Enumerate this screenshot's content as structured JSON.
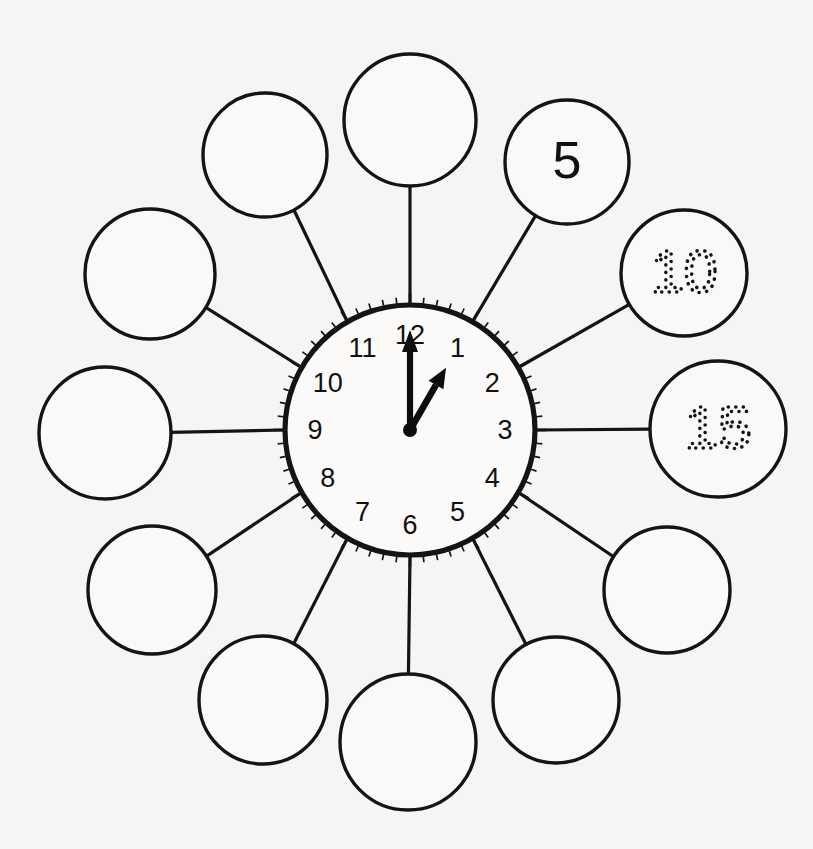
{
  "page": {
    "background_color": "#f6f5f3",
    "ink_color": "#141414",
    "width": 813,
    "height": 849
  },
  "clock": {
    "label": "analog-clock-face",
    "center_x": 410,
    "center_y": 430,
    "rim_radius": 125,
    "numeral_radius": 95,
    "displayed_time": "1:00",
    "hour_hand_points_to": 1,
    "minute_hand_points_to": 12,
    "minute_hand_length": 100,
    "hour_hand_length": 72,
    "hour_numerals": [
      {
        "hour": 12,
        "label": "12",
        "angle_deg": 0
      },
      {
        "hour": 1,
        "label": "1",
        "angle_deg": 30
      },
      {
        "hour": 2,
        "label": "2",
        "angle_deg": 60
      },
      {
        "hour": 3,
        "label": "3",
        "angle_deg": 90
      },
      {
        "hour": 4,
        "label": "4",
        "angle_deg": 120
      },
      {
        "hour": 5,
        "label": "5",
        "angle_deg": 150
      },
      {
        "hour": 6,
        "label": "6",
        "angle_deg": 180
      },
      {
        "hour": 7,
        "label": "7",
        "angle_deg": 210
      },
      {
        "hour": 8,
        "label": "8",
        "angle_deg": 240
      },
      {
        "hour": 9,
        "label": "9",
        "angle_deg": 270
      },
      {
        "hour": 10,
        "label": "10",
        "angle_deg": 300
      },
      {
        "hour": 11,
        "label": "11",
        "angle_deg": 330
      }
    ],
    "minute_ticks": 60,
    "ticks_outside_rim": true
  },
  "bubbles": [
    {
      "position": 12,
      "angle_deg": 0,
      "cx": 410,
      "cy": 120,
      "r": 66,
      "value": "",
      "style": "blank",
      "name": "answer-bubble-12"
    },
    {
      "position": 1,
      "angle_deg": 30,
      "cx": 567,
      "cy": 162,
      "r": 62,
      "value": "5",
      "style": "solid",
      "name": "answer-bubble-1"
    },
    {
      "position": 2,
      "angle_deg": 60,
      "cx": 684,
      "cy": 273,
      "r": 63,
      "value": "10",
      "style": "dotted",
      "name": "answer-bubble-2"
    },
    {
      "position": 3,
      "angle_deg": 90,
      "cx": 718,
      "cy": 429,
      "r": 68,
      "value": "15",
      "style": "dotted",
      "name": "answer-bubble-3"
    },
    {
      "position": 4,
      "angle_deg": 120,
      "cx": 667,
      "cy": 590,
      "r": 63,
      "value": "",
      "style": "blank",
      "name": "answer-bubble-4"
    },
    {
      "position": 5,
      "angle_deg": 150,
      "cx": 556,
      "cy": 700,
      "r": 63,
      "value": "",
      "style": "blank",
      "name": "answer-bubble-5"
    },
    {
      "position": 6,
      "angle_deg": 180,
      "cx": 408,
      "cy": 742,
      "r": 68,
      "value": "",
      "style": "blank",
      "name": "answer-bubble-6"
    },
    {
      "position": 7,
      "angle_deg": 210,
      "cx": 263,
      "cy": 700,
      "r": 64,
      "value": "",
      "style": "blank",
      "name": "answer-bubble-7"
    },
    {
      "position": 8,
      "angle_deg": 240,
      "cx": 152,
      "cy": 590,
      "r": 64,
      "value": "",
      "style": "blank",
      "name": "answer-bubble-8"
    },
    {
      "position": 9,
      "angle_deg": 270,
      "cx": 105,
      "cy": 433,
      "r": 66,
      "value": "",
      "style": "blank",
      "name": "answer-bubble-9"
    },
    {
      "position": 10,
      "angle_deg": 300,
      "cx": 150,
      "cy": 274,
      "r": 65,
      "value": "",
      "style": "blank",
      "name": "answer-bubble-10"
    },
    {
      "position": 11,
      "angle_deg": 330,
      "cx": 265,
      "cy": 155,
      "r": 62,
      "value": "",
      "style": "blank",
      "name": "answer-bubble-11"
    }
  ]
}
